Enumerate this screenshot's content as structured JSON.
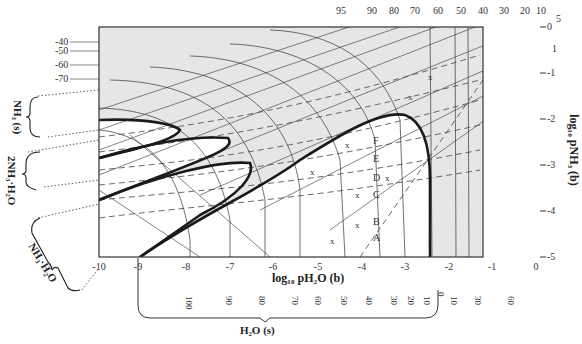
{
  "diagram": {
    "x_axis": {
      "title": "log₁₀ pH₂O   (b)",
      "ticks": [
        "-10",
        "-9",
        "-8",
        "-7",
        "-6",
        "-5",
        "-4",
        "-3",
        "-2",
        "-1",
        "0"
      ]
    },
    "y_axis": {
      "title": "log₁₀ pNH₃   (b)",
      "ticks": [
        "0",
        "-1",
        "-2",
        "-3",
        "-4",
        "-5"
      ]
    },
    "top_labels": [
      "95",
      "90",
      "80",
      "70",
      "60",
      "50",
      "40",
      "30",
      "20",
      "10"
    ],
    "right_top_labels": [
      "5",
      "1"
    ],
    "left_labels": [
      "-40",
      "-50",
      "-60",
      "-70"
    ],
    "bottom_rotated_labels": [
      "100",
      "90",
      "80",
      "70",
      "60",
      "50",
      "40",
      "30",
      "20",
      "10",
      "0",
      "10",
      "30",
      "60"
    ],
    "trajectory_labels": [
      "A",
      "B",
      "C",
      "D",
      "E",
      "F"
    ],
    "marker": "x",
    "phases": {
      "nh3_solid": "NH₃ (s)",
      "dihydrate": "2NH₃·H₂O",
      "monohydrate": "NH₃·H₂O",
      "water_ice": "H₂O (s)"
    }
  }
}
